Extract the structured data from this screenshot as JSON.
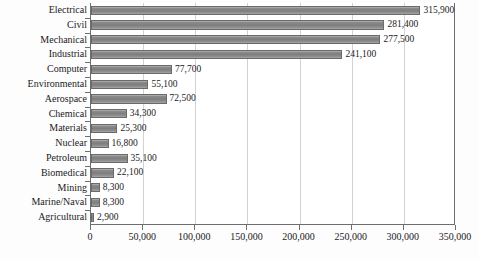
{
  "chart_data": {
    "type": "bar",
    "orientation": "horizontal",
    "title": "",
    "xlabel": "",
    "ylabel": "",
    "xlim": [
      0,
      350000
    ],
    "xticks": [
      0,
      50000,
      100000,
      150000,
      200000,
      250000,
      300000,
      350000
    ],
    "xtick_labels": [
      "0",
      "50,000",
      "100,000",
      "150,000",
      "200,000",
      "250,000",
      "300,000",
      "350,000"
    ],
    "grid": true,
    "grid_axis": "x",
    "legend": false,
    "categories": [
      "Electrical",
      "Civil",
      "Mechanical",
      "Industrial",
      "Computer",
      "Environmental",
      "Aerospace",
      "Chemical",
      "Materials",
      "Nuclear",
      "Petroleum",
      "Biomedical",
      "Mining",
      "Marine/Naval",
      "Agricultural"
    ],
    "values": [
      315900,
      281400,
      277500,
      241100,
      77700,
      55100,
      72500,
      34300,
      25300,
      16800,
      35100,
      22100,
      8300,
      8300,
      2900
    ],
    "value_labels": [
      "315,900",
      "281,400",
      "277,500",
      "241,100",
      "77,700",
      "55,100",
      "72,500",
      "34,300",
      "25,300",
      "16,800",
      "35,100",
      "22,100",
      "8,300",
      "8,300",
      "2,900"
    ],
    "colors": {
      "bar_fill": "#808080",
      "bar_edge": "#6a6a6a",
      "gridline": "#d2d2d6",
      "axis": "#6e6e6e",
      "text": "#1b1b1b",
      "background": "#fdfdfe",
      "plot_background": "#ffffff"
    }
  }
}
